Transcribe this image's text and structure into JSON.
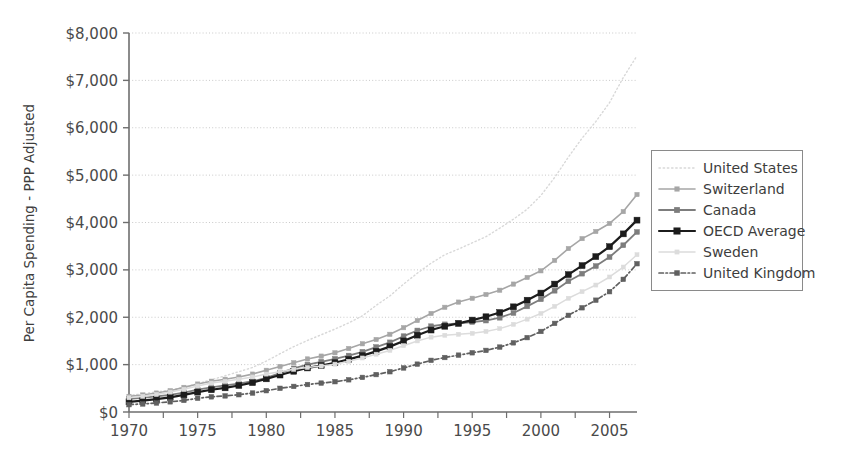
{
  "chart_data": {
    "type": "line",
    "title": "",
    "xlabel": "",
    "ylabel": "Per Capita Spending - PPP Adjusted",
    "xlim": [
      1970,
      2007
    ],
    "ylim": [
      0,
      8000
    ],
    "y_tick_labels": [
      "$0",
      "$1,000",
      "$2,000",
      "$3,000",
      "$4,000",
      "$5,000",
      "$6,000",
      "$7,000",
      "$8,000"
    ],
    "y_tick_values": [
      0,
      1000,
      2000,
      3000,
      4000,
      5000,
      6000,
      7000,
      8000
    ],
    "x_tick_labels": [
      "1970",
      "1975",
      "1980",
      "1985",
      "1990",
      "1995",
      "2000",
      "2005"
    ],
    "x_tick_values": [
      1970,
      1975,
      1980,
      1985,
      1990,
      1995,
      2000,
      2005
    ],
    "x_minor_step": 2.5,
    "grid": "horizontal-dotted",
    "legend_position": "right",
    "x": [
      1970,
      1971,
      1972,
      1973,
      1974,
      1975,
      1976,
      1977,
      1978,
      1979,
      1980,
      1981,
      1982,
      1983,
      1984,
      1985,
      1986,
      1987,
      1988,
      1989,
      1990,
      1991,
      1992,
      1993,
      1994,
      1995,
      1996,
      1997,
      1998,
      1999,
      2000,
      2001,
      2002,
      2003,
      2004,
      2005,
      2006,
      2007
    ],
    "series": [
      {
        "name": "United States",
        "color": "#d8d8d8",
        "style": "dotted",
        "marker": "none",
        "width": 1.4,
        "values": [
          350,
          385,
          425,
          465,
          520,
          600,
          680,
          765,
          850,
          940,
          1075,
          1230,
          1380,
          1510,
          1630,
          1750,
          1880,
          2030,
          2250,
          2450,
          2700,
          2930,
          3140,
          3320,
          3440,
          3570,
          3700,
          3880,
          4070,
          4280,
          4570,
          4950,
          5380,
          5780,
          6130,
          6530,
          7060,
          7520
        ]
      },
      {
        "name": "Switzerland",
        "color": "#a6a6a6",
        "style": "solid",
        "marker": "square",
        "width": 1.6,
        "values": [
          330,
          360,
          400,
          450,
          520,
          590,
          650,
          690,
          740,
          800,
          880,
          960,
          1040,
          1120,
          1180,
          1250,
          1340,
          1440,
          1530,
          1640,
          1780,
          1930,
          2080,
          2210,
          2320,
          2400,
          2480,
          2570,
          2700,
          2840,
          2980,
          3200,
          3450,
          3660,
          3810,
          3980,
          4230,
          4590
        ]
      },
      {
        "name": "Canada",
        "color": "#7d7d7d",
        "style": "solid",
        "marker": "square",
        "width": 1.8,
        "values": [
          280,
          300,
          330,
          360,
          410,
          470,
          520,
          560,
          600,
          650,
          720,
          820,
          920,
          1000,
          1060,
          1120,
          1190,
          1270,
          1370,
          1470,
          1600,
          1720,
          1810,
          1850,
          1870,
          1900,
          1930,
          1990,
          2090,
          2230,
          2380,
          2560,
          2760,
          2920,
          3080,
          3270,
          3520,
          3800
        ]
      },
      {
        "name": "OECD Average",
        "color": "#1c1c1c",
        "style": "solid",
        "marker": "square",
        "width": 2.2,
        "values": [
          215,
          240,
          270,
          310,
          360,
          420,
          470,
          510,
          560,
          620,
          700,
          780,
          860,
          930,
          980,
          1040,
          1110,
          1190,
          1280,
          1380,
          1500,
          1620,
          1730,
          1810,
          1870,
          1940,
          2010,
          2100,
          2220,
          2360,
          2510,
          2700,
          2900,
          3090,
          3280,
          3490,
          3760,
          4050
        ]
      },
      {
        "name": "Sweden",
        "color": "#dcdcdc",
        "style": "solid",
        "marker": "square",
        "width": 1.5,
        "values": [
          300,
          330,
          370,
          420,
          480,
          550,
          610,
          650,
          690,
          740,
          800,
          850,
          900,
          940,
          970,
          1010,
          1070,
          1140,
          1220,
          1300,
          1400,
          1500,
          1580,
          1620,
          1640,
          1660,
          1700,
          1760,
          1850,
          1960,
          2080,
          2230,
          2400,
          2540,
          2680,
          2850,
          3060,
          3320
        ]
      },
      {
        "name": "United Kingdom",
        "color": "#606060",
        "style": "dashdot",
        "marker": "square",
        "width": 1.7,
        "values": [
          155,
          170,
          190,
          215,
          245,
          290,
          320,
          340,
          365,
          400,
          450,
          500,
          540,
          580,
          610,
          640,
          680,
          730,
          790,
          850,
          930,
          1010,
          1090,
          1150,
          1200,
          1250,
          1300,
          1370,
          1460,
          1570,
          1700,
          1870,
          2040,
          2200,
          2360,
          2540,
          2800,
          3130
        ]
      }
    ]
  },
  "legend": {
    "items": [
      {
        "label": "United States"
      },
      {
        "label": "Switzerland"
      },
      {
        "label": "Canada"
      },
      {
        "label": "OECD Average"
      },
      {
        "label": "Sweden"
      },
      {
        "label": "United Kingdom"
      }
    ]
  }
}
